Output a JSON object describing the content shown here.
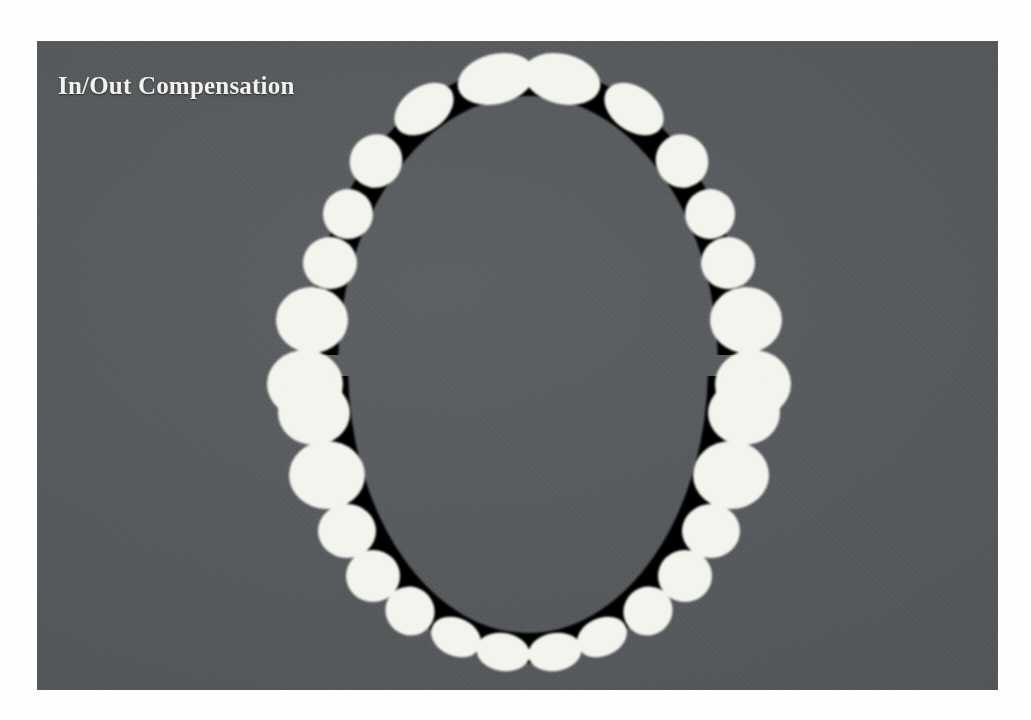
{
  "slide": {
    "title": "In/Out Compensation",
    "background_color": "#55595c",
    "title_color": "#f2f2ee",
    "board_border_color": "#ffffff"
  },
  "diagram": {
    "name": "dental-arch-occlusal-view",
    "arch_outline_color": "#060606",
    "tooth_color": "#f4f4ef",
    "arches": [
      {
        "name": "upper-arch",
        "label": "Maxillary arch",
        "tooth_count": 16
      },
      {
        "name": "lower-arch",
        "label": "Mandibular arch",
        "tooth_count": 16
      }
    ],
    "total_teeth": 32
  }
}
